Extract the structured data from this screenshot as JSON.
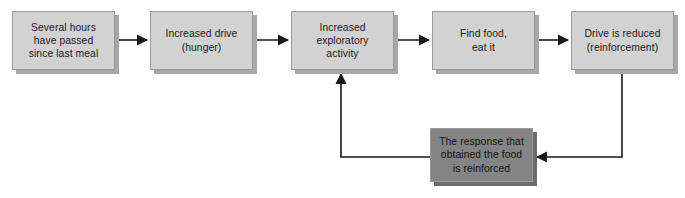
{
  "diagram": {
    "type": "flowchart",
    "canvas": {
      "width": 685,
      "height": 198,
      "background": "#ffffff"
    },
    "colors": {
      "box_light_fill": "#d2d2d2",
      "box_dark_fill": "#848484",
      "box_border": "#9a9a9a",
      "box_shadow": "#a8a8a8",
      "connector": "#1a1a1a",
      "text": "#1a1a1a"
    },
    "nodes": [
      {
        "id": "node-several-hours",
        "label": "Several hours\nhave passed\nsince last meal",
        "style": "light",
        "x": 12,
        "y": 11,
        "width": 103,
        "height": 59
      },
      {
        "id": "node-increased-drive",
        "label": "Increased drive\n(hunger)",
        "style": "light",
        "x": 150,
        "y": 11,
        "width": 103,
        "height": 59
      },
      {
        "id": "node-exploratory-activity",
        "label": "Increased\nexploratory\nactivity",
        "style": "light",
        "x": 291,
        "y": 11,
        "width": 103,
        "height": 59
      },
      {
        "id": "node-find-food",
        "label": "Find food,\neat it",
        "style": "light",
        "x": 432,
        "y": 11,
        "width": 103,
        "height": 59
      },
      {
        "id": "node-drive-reduced",
        "label": "Drive is reduced\n(reinforcement)",
        "style": "light",
        "x": 571,
        "y": 11,
        "width": 103,
        "height": 59
      },
      {
        "id": "node-response-reinforced",
        "label": "The response that\nobtained the food\nis reinforced",
        "style": "dark",
        "x": 430,
        "y": 128,
        "width": 103,
        "height": 54
      }
    ],
    "connectors": [
      {
        "id": "edge-hours-to-drive",
        "from": "node-several-hours",
        "to": "node-increased-drive",
        "direction": "right"
      },
      {
        "id": "edge-drive-to-activity",
        "from": "node-increased-drive",
        "to": "node-exploratory-activity",
        "direction": "right"
      },
      {
        "id": "edge-activity-to-food",
        "from": "node-exploratory-activity",
        "to": "node-find-food",
        "direction": "right"
      },
      {
        "id": "edge-food-to-reduced",
        "from": "node-find-food",
        "to": "node-drive-reduced",
        "direction": "right"
      },
      {
        "id": "edge-reduced-to-response",
        "from": "node-drive-reduced",
        "to": "node-response-reinforced",
        "direction": "down-left"
      },
      {
        "id": "edge-response-to-activity",
        "from": "node-response-reinforced",
        "to": "node-exploratory-activity",
        "direction": "left-up"
      }
    ]
  }
}
